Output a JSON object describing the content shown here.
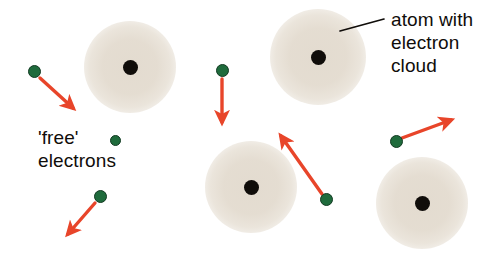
{
  "figure": {
    "background_color": "#ffffff",
    "width": 483,
    "height": 257
  },
  "labels": {
    "atom_label": "atom with\nelectron\ncloud",
    "free_electrons_label": "'free'\nelectrons"
  },
  "colors": {
    "arrow": "#e8452a",
    "electron_fill": "#1f6b3c",
    "electron_stroke": "#123a22",
    "nucleus": "#100d0a",
    "cloud": "#e2dace",
    "text": "#100d0a",
    "leader_line": "#100d0a"
  },
  "atoms": [
    {
      "name": "atom-top-left",
      "cx": 130,
      "cy": 67,
      "cloud_r": 46,
      "nucleus_r": 7.5
    },
    {
      "name": "atom-top-right",
      "cx": 318,
      "cy": 57,
      "cloud_r": 48,
      "nucleus_r": 7.5
    },
    {
      "name": "atom-bottom-center",
      "cx": 251,
      "cy": 187,
      "cloud_r": 46,
      "nucleus_r": 7.5
    },
    {
      "name": "atom-bottom-right",
      "cx": 422,
      "cy": 203,
      "cloud_r": 46,
      "nucleus_r": 7.5
    }
  ],
  "electrons": [
    {
      "name": "electron-upper-left",
      "cx": 34,
      "cy": 71,
      "r": 6.5
    },
    {
      "name": "electron-upper-center",
      "cx": 222,
      "cy": 70,
      "r": 6.5
    },
    {
      "name": "electron-legend-swatch",
      "cx": 115,
      "cy": 140,
      "r": 5.5
    },
    {
      "name": "electron-lower-left",
      "cx": 100,
      "cy": 196,
      "r": 6.5
    },
    {
      "name": "electron-lower-center",
      "cx": 326,
      "cy": 199,
      "r": 6.5
    },
    {
      "name": "electron-right",
      "cx": 396,
      "cy": 141,
      "r": 6.5
    }
  ],
  "arrows": [
    {
      "name": "arrow-upper-left",
      "x1": 40,
      "y1": 78,
      "x2": 73,
      "y2": 108,
      "direction": "down-right"
    },
    {
      "name": "arrow-upper-center",
      "x1": 222,
      "y1": 79,
      "x2": 222,
      "y2": 122,
      "direction": "down"
    },
    {
      "name": "arrow-lower-left",
      "x1": 95,
      "y1": 203,
      "x2": 68,
      "y2": 234,
      "direction": "down-left"
    },
    {
      "name": "arrow-lower-center",
      "x1": 322,
      "y1": 194,
      "x2": 281,
      "y2": 136,
      "direction": "up-left"
    },
    {
      "name": "arrow-right",
      "x1": 402,
      "y1": 138,
      "x2": 451,
      "y2": 120,
      "direction": "up-right"
    }
  ],
  "leader_line": {
    "name": "leader-line-atom-label",
    "x1": 340,
    "y1": 31,
    "x2": 384,
    "y2": 19
  }
}
